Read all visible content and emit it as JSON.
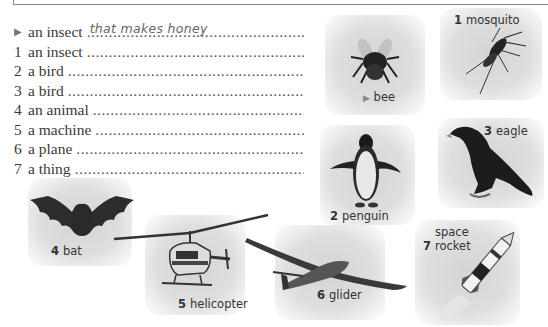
{
  "worksheet": {
    "list": [
      {
        "marker": "▶",
        "prompt": "an insect",
        "answer": "that makes honey"
      },
      {
        "marker": "1",
        "prompt": "an insect",
        "answer": ""
      },
      {
        "marker": "2",
        "prompt": "a bird",
        "answer": ""
      },
      {
        "marker": "3",
        "prompt": "a bird",
        "answer": ""
      },
      {
        "marker": "4",
        "prompt": "an animal",
        "answer": ""
      },
      {
        "marker": "5",
        "prompt": "a machine",
        "answer": ""
      },
      {
        "marker": "6",
        "prompt": "a plane",
        "answer": ""
      },
      {
        "marker": "7",
        "prompt": "a thing",
        "answer": ""
      }
    ],
    "pictures": [
      {
        "marker": "▶",
        "name": "bee",
        "icon": "bee-icon"
      },
      {
        "marker": "1",
        "name": "mosquito",
        "icon": "mosquito-icon"
      },
      {
        "marker": "2",
        "name": "penguin",
        "icon": "penguin-icon"
      },
      {
        "marker": "3",
        "name": "eagle",
        "icon": "eagle-icon"
      },
      {
        "marker": "4",
        "name": "bat",
        "icon": "bat-icon"
      },
      {
        "marker": "5",
        "name": "helicopter",
        "icon": "helicopter-icon"
      },
      {
        "marker": "6",
        "name": "glider",
        "icon": "glider-icon"
      },
      {
        "marker": "7",
        "name": "space rocket",
        "icon": "rocket-icon"
      }
    ]
  }
}
